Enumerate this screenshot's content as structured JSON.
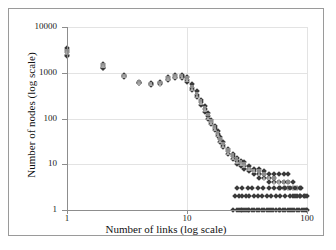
{
  "chart_data": {
    "type": "scatter",
    "title": "Node connectivity distribution",
    "xlabel": "Number of links (log scale)",
    "ylabel": "Number of nodes (log scale)",
    "xscale": "log",
    "yscale": "log",
    "xlim": [
      1,
      100
    ],
    "ylim": [
      1,
      10000
    ],
    "xticks": [
      1,
      10,
      100
    ],
    "xtick_labels": [
      "1",
      "10",
      "100"
    ],
    "yticks": [
      1,
      10,
      100,
      1000,
      10000
    ],
    "ytick_labels": [
      "1",
      "10",
      "100",
      "1000",
      "10000"
    ],
    "grid": true,
    "legend": "none",
    "marker_colors": {
      "diamond": "#3a3a3a",
      "square": "#8c8c8c",
      "triangle": "#a8a8a8"
    },
    "series": [
      {
        "name": "run-1",
        "marker": "diamond",
        "points": [
          [
            1,
            3500
          ],
          [
            1,
            3100
          ],
          [
            1,
            2800
          ],
          [
            1,
            2500
          ],
          [
            1,
            2300
          ],
          [
            2,
            1550
          ],
          [
            2,
            1400
          ],
          [
            2,
            1300
          ],
          [
            2,
            1250
          ],
          [
            3,
            900
          ],
          [
            3,
            840
          ],
          [
            3,
            800
          ],
          [
            4,
            640
          ],
          [
            4,
            610
          ],
          [
            4,
            590
          ],
          [
            5,
            600
          ],
          [
            5,
            570
          ],
          [
            5,
            550
          ],
          [
            6,
            620
          ],
          [
            6,
            590
          ],
          [
            6,
            570
          ],
          [
            7,
            800
          ],
          [
            7,
            740
          ],
          [
            7,
            700
          ],
          [
            8,
            880
          ],
          [
            8,
            820
          ],
          [
            8,
            780
          ],
          [
            9,
            900
          ],
          [
            9,
            840
          ],
          [
            9,
            800
          ],
          [
            9,
            760
          ],
          [
            10,
            820
          ],
          [
            10,
            700
          ],
          [
            10,
            640
          ],
          [
            11,
            560
          ],
          [
            11,
            470
          ],
          [
            11,
            420
          ],
          [
            12,
            390
          ],
          [
            12,
            330
          ],
          [
            12,
            300
          ],
          [
            13,
            260
          ],
          [
            13,
            230
          ],
          [
            13,
            200
          ],
          [
            14,
            185
          ],
          [
            14,
            160
          ],
          [
            14,
            140
          ],
          [
            15,
            130
          ],
          [
            15,
            115
          ],
          [
            15,
            100
          ],
          [
            16,
            95
          ],
          [
            16,
            85
          ],
          [
            16,
            75
          ],
          [
            17,
            70
          ],
          [
            17,
            62
          ],
          [
            17,
            55
          ],
          [
            18,
            52
          ],
          [
            18,
            46
          ],
          [
            18,
            41
          ],
          [
            19,
            40
          ],
          [
            19,
            35
          ],
          [
            19,
            31
          ],
          [
            20,
            30
          ],
          [
            20,
            27
          ],
          [
            20,
            24
          ],
          [
            22,
            22
          ],
          [
            22,
            19
          ],
          [
            22,
            17
          ],
          [
            24,
            17
          ],
          [
            24,
            15
          ],
          [
            24,
            13
          ],
          [
            26,
            14
          ],
          [
            26,
            12
          ],
          [
            26,
            10
          ],
          [
            28,
            12
          ],
          [
            28,
            10
          ],
          [
            28,
            9
          ],
          [
            30,
            11
          ],
          [
            30,
            9
          ],
          [
            30,
            8
          ],
          [
            33,
            9
          ],
          [
            33,
            8
          ],
          [
            33,
            7
          ],
          [
            36,
            8
          ],
          [
            36,
            7
          ],
          [
            36,
            6
          ],
          [
            40,
            8
          ],
          [
            40,
            6
          ],
          [
            40,
            5
          ],
          [
            44,
            7
          ],
          [
            44,
            6
          ],
          [
            44,
            5
          ],
          [
            48,
            6
          ],
          [
            48,
            5
          ],
          [
            48,
            4
          ],
          [
            53,
            6
          ],
          [
            53,
            5
          ],
          [
            53,
            4
          ],
          [
            58,
            6
          ],
          [
            58,
            4
          ],
          [
            58,
            3
          ],
          [
            64,
            6
          ],
          [
            64,
            4
          ],
          [
            64,
            3
          ],
          [
            70,
            6
          ],
          [
            70,
            4
          ],
          [
            70,
            3
          ],
          [
            76,
            4
          ],
          [
            76,
            3
          ],
          [
            76,
            2
          ],
          [
            82,
            3
          ],
          [
            82,
            2
          ],
          [
            88,
            3
          ],
          [
            88,
            2
          ],
          [
            94,
            2
          ],
          [
            100,
            2
          ]
        ]
      },
      {
        "name": "run-2",
        "marker": "square",
        "points": [
          [
            1,
            3000
          ],
          [
            1,
            2600
          ],
          [
            2,
            1450
          ],
          [
            2,
            1350
          ],
          [
            3,
            870
          ],
          [
            3,
            820
          ],
          [
            4,
            620
          ],
          [
            5,
            580
          ],
          [
            6,
            600
          ],
          [
            7,
            760
          ],
          [
            8,
            840
          ],
          [
            9,
            860
          ],
          [
            10,
            760
          ],
          [
            11,
            500
          ],
          [
            12,
            350
          ],
          [
            13,
            240
          ],
          [
            14,
            170
          ],
          [
            15,
            120
          ],
          [
            16,
            88
          ],
          [
            17,
            64
          ],
          [
            18,
            48
          ],
          [
            19,
            36
          ],
          [
            20,
            28
          ],
          [
            22,
            20
          ],
          [
            24,
            16
          ],
          [
            26,
            13
          ],
          [
            28,
            11
          ],
          [
            30,
            10
          ],
          [
            33,
            8
          ],
          [
            36,
            7
          ],
          [
            40,
            7
          ],
          [
            44,
            6
          ],
          [
            48,
            5
          ],
          [
            53,
            5
          ],
          [
            58,
            4
          ],
          [
            64,
            4
          ],
          [
            70,
            4
          ],
          [
            76,
            3
          ],
          [
            82,
            3
          ],
          [
            88,
            2
          ]
        ]
      },
      {
        "name": "run-3",
        "marker": "triangle",
        "points": [
          [
            1,
            2900
          ],
          [
            2,
            1380
          ],
          [
            3,
            830
          ],
          [
            4,
            600
          ],
          [
            5,
            560
          ],
          [
            6,
            580
          ],
          [
            7,
            720
          ],
          [
            8,
            800
          ],
          [
            9,
            820
          ],
          [
            10,
            680
          ],
          [
            11,
            440
          ],
          [
            12,
            310
          ],
          [
            13,
            215
          ],
          [
            14,
            150
          ],
          [
            15,
            105
          ],
          [
            16,
            80
          ],
          [
            17,
            58
          ],
          [
            18,
            43
          ],
          [
            19,
            33
          ],
          [
            20,
            25
          ],
          [
            22,
            18
          ],
          [
            24,
            14
          ],
          [
            26,
            11
          ],
          [
            28,
            10
          ],
          [
            30,
            9
          ],
          [
            33,
            8
          ],
          [
            36,
            7
          ],
          [
            40,
            6
          ],
          [
            44,
            5
          ],
          [
            48,
            5
          ],
          [
            53,
            4
          ],
          [
            58,
            4
          ],
          [
            64,
            3
          ],
          [
            70,
            3
          ],
          [
            76,
            3
          ]
        ]
      },
      {
        "name": "floor-counts",
        "marker": "diamond",
        "points": [
          [
            24,
            1
          ],
          [
            26,
            1
          ],
          [
            27,
            1
          ],
          [
            28,
            1
          ],
          [
            29,
            1
          ],
          [
            30,
            1
          ],
          [
            31,
            1
          ],
          [
            32,
            1
          ],
          [
            33,
            1
          ],
          [
            35,
            1
          ],
          [
            36,
            1
          ],
          [
            38,
            1
          ],
          [
            40,
            1
          ],
          [
            42,
            1
          ],
          [
            44,
            1
          ],
          [
            46,
            1
          ],
          [
            48,
            1
          ],
          [
            50,
            1
          ],
          [
            52,
            1
          ],
          [
            55,
            1
          ],
          [
            58,
            1
          ],
          [
            60,
            1
          ],
          [
            63,
            1
          ],
          [
            66,
            1
          ],
          [
            69,
            1
          ],
          [
            72,
            1
          ],
          [
            75,
            1
          ],
          [
            78,
            1
          ],
          [
            82,
            1
          ],
          [
            86,
            1
          ],
          [
            90,
            1
          ],
          [
            94,
            1
          ],
          [
            98,
            1
          ],
          [
            100,
            1
          ],
          [
            25,
            2
          ],
          [
            27,
            2
          ],
          [
            29,
            2
          ],
          [
            31,
            2
          ],
          [
            33,
            2
          ],
          [
            36,
            2
          ],
          [
            39,
            2
          ],
          [
            42,
            2
          ],
          [
            46,
            2
          ],
          [
            50,
            2
          ],
          [
            55,
            2
          ],
          [
            60,
            2
          ],
          [
            66,
            2
          ],
          [
            72,
            2
          ],
          [
            80,
            2
          ],
          [
            88,
            2
          ],
          [
            96,
            2
          ],
          [
            26,
            3
          ],
          [
            29,
            3
          ],
          [
            32,
            3
          ],
          [
            35,
            3
          ],
          [
            39,
            3
          ],
          [
            43,
            3
          ],
          [
            48,
            3
          ],
          [
            53,
            3
          ],
          [
            59,
            3
          ],
          [
            65,
            3
          ],
          [
            72,
            3
          ],
          [
            80,
            3
          ],
          [
            89,
            3
          ]
        ]
      }
    ]
  }
}
